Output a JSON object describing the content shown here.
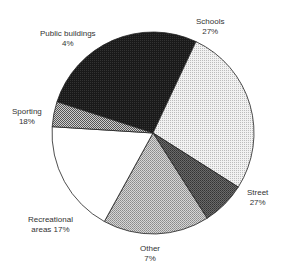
{
  "chart_data": {
    "type": "pie",
    "title": "",
    "categories": [
      "Schools",
      "Street",
      "Other",
      "Recreational areas",
      "Sporting",
      "Public buildings"
    ],
    "values": [
      27,
      27,
      7,
      17,
      18,
      4
    ],
    "unit": "%",
    "start_angle_deg": -72,
    "direction": "clockwise",
    "legend": "none (direct labels)",
    "fills": [
      "dark-dense",
      "light-dotted",
      "medium-dark-dotted",
      "medium-dotted",
      "white",
      "checkered"
    ]
  },
  "labels": {
    "schools": {
      "name": "Schools",
      "value": "27%"
    },
    "street": {
      "name": "Street",
      "value": "27%"
    },
    "other": {
      "name": "Other",
      "value": "7%"
    },
    "recreational": {
      "name": "Recreational",
      "value": "areas 17%"
    },
    "sporting": {
      "name": "Sporting",
      "value": "18%"
    },
    "public": {
      "name": "Public buildings",
      "value": "4%"
    }
  }
}
